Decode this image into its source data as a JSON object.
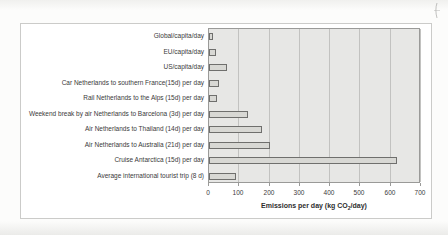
{
  "page": {
    "kind": "scanned book page fragment with bar chart"
  },
  "chart": {
    "axis_title_prefix": "Emissions per day (kg CO",
    "axis_title_sub": "2",
    "axis_title_suffix": "/day)"
  },
  "chart_data": {
    "type": "bar",
    "orientation": "horizontal",
    "title": "",
    "categories": [
      "Global/capita/day",
      "EU/capita/day",
      "US/capita/day",
      "Car Netherlands to southern France(15d) per day",
      "Rail Netherlands to the Alps (15d) per day",
      "Weekend break by air Netherlands to Barcelona (3d) per day",
      "Air Netherlands to Thailand (14d) per day",
      "Air Netherlands to Australia (21d) per day",
      "Cruise Antarctica (15d) per day",
      "Average international tourist trip (8 d)"
    ],
    "values": [
      12,
      22,
      60,
      32,
      27,
      130,
      175,
      200,
      620,
      90
    ],
    "xlabel": "Emissions per day (kg CO2/day)",
    "ylabel": "",
    "xlim": [
      0,
      700
    ],
    "x_ticks": [
      0,
      100,
      200,
      300,
      400,
      500,
      600,
      700
    ],
    "grid": true,
    "legend": false,
    "colors": {
      "plot_bg": "#e7e7e5",
      "bar_fill": "#d8d8d4",
      "bar_border": "#6f6f6d",
      "grid": "#c2c2c0",
      "frame_border": "#cbcbc9",
      "text": "#3a3a3a"
    }
  }
}
